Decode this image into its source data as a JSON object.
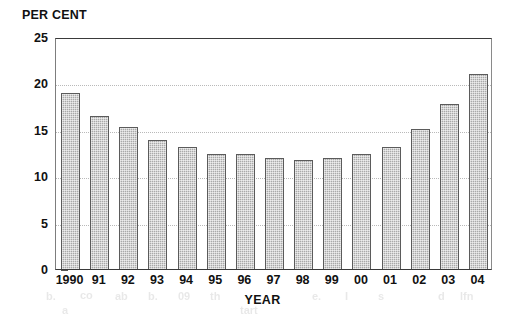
{
  "chart_data": {
    "type": "bar",
    "title": "",
    "ylabel": "PER CENT",
    "xlabel": "YEAR",
    "categories": [
      "1990",
      "91",
      "92",
      "93",
      "94",
      "95",
      "96",
      "97",
      "98",
      "99",
      "00",
      "01",
      "02",
      "03",
      "04"
    ],
    "values": [
      19.0,
      16.5,
      15.3,
      13.9,
      13.2,
      12.4,
      12.4,
      12.0,
      11.8,
      12.0,
      12.4,
      13.1,
      15.1,
      17.8,
      21.0
    ],
    "ylim": [
      0,
      25
    ],
    "yticks": [
      0,
      5,
      10,
      15,
      20,
      25
    ],
    "ytick_labels": [
      "0",
      "5",
      "10",
      "15",
      "20",
      "25"
    ],
    "grid": true,
    "grid_axis": "y",
    "legend": "none",
    "bar_color": "#a9a9a9",
    "bar_edge_color": "#5b5b5b",
    "axis_color": "#3a3a3a",
    "gridline_color": "#b9b9b9",
    "text_color": "#111111",
    "background": "#ffffff"
  },
  "artifacts": [
    {
      "text": "b.",
      "x": 46,
      "y": 2
    },
    {
      "text": "co",
      "x": 80,
      "y": 1
    },
    {
      "text": "ab",
      "x": 115,
      "y": 2
    },
    {
      "text": "b.",
      "x": 148,
      "y": 2
    },
    {
      "text": "09",
      "x": 178,
      "y": 2
    },
    {
      "text": "th",
      "x": 210,
      "y": 2
    },
    {
      "text": "e.",
      "x": 312,
      "y": 2
    },
    {
      "text": "I",
      "x": 345,
      "y": 2
    },
    {
      "text": "s",
      "x": 378,
      "y": 2
    },
    {
      "text": "d",
      "x": 438,
      "y": 2
    },
    {
      "text": "lfn",
      "x": 460,
      "y": 2
    },
    {
      "text": "a",
      "x": 62,
      "y": 16
    },
    {
      "text": "tart",
      "x": 240,
      "y": 16
    }
  ]
}
